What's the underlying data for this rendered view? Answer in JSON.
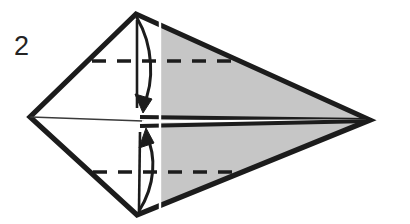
{
  "figure": {
    "type": "origami-fold-diagram",
    "step_label": "2",
    "background_color": "#ffffff",
    "ink_color": "#1c1c1c",
    "paper_shaded_color": "#c6c6c6",
    "paper_white_color": "#ffffff",
    "crease_white_color": "#ffffff"
  },
  "geometry": {
    "outline_points": "136,14 370,120 137,215 30,117",
    "vertices": {
      "top": {
        "x": 136,
        "y": 14,
        "name": "top-corner"
      },
      "right": {
        "x": 370,
        "y": 120,
        "name": "right-point"
      },
      "bottom": {
        "x": 137,
        "y": 215,
        "name": "bottom-corner"
      },
      "left": {
        "x": 30,
        "y": 117,
        "name": "left-corner"
      }
    },
    "shaded_polygon": "136,14 370,120 137,215 160,215 160,14",
    "shaded_polygon_note": "grey region right of the vertical white crease",
    "center_line": {
      "x1": 30,
      "y1": 117,
      "x2": 370,
      "y2": 120
    },
    "center_thick_start_x": 140,
    "vertical_crease": {
      "x": 160,
      "y1": 16,
      "y2": 214
    },
    "dashed_line_upper": {
      "x1": 92,
      "y1": 61,
      "x2": 232,
      "y2": 61
    },
    "dashed_line_lower": {
      "x1": 93,
      "y1": 172,
      "x2": 236,
      "y2": 172
    },
    "arrow_upper": {
      "path": "M 137,18 C 153,45 155,82 143,106",
      "head": "143,112 136,96 152,99",
      "direction": "down"
    },
    "arrow_lower": {
      "path": "M 139,211 C 154,185 156,155 145,134",
      "head": "145,128 139,146 153,142",
      "direction": "up"
    }
  },
  "labels": {
    "step": "2"
  }
}
